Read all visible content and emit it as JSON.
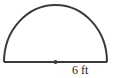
{
  "figure": {
    "shape": "semicircle",
    "radius_label": "6 ft",
    "stroke_color": "#3a3a3a"
  }
}
